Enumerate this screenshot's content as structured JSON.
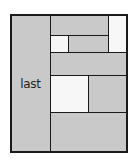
{
  "diagram": {
    "type": "rectangle-partition",
    "colors": {
      "filled": "#c9c9c9",
      "empty": "#f7f7f7",
      "stroke": "#1a1a1a"
    },
    "cells": [
      {
        "id": "last",
        "label": "last",
        "fill": "filled"
      },
      {
        "id": "r1-left",
        "label": "",
        "fill": "filled"
      },
      {
        "id": "r1-right",
        "label": "",
        "fill": "empty"
      },
      {
        "id": "r2-small",
        "label": "",
        "fill": "empty"
      },
      {
        "id": "r2-mid",
        "label": "",
        "fill": "filled"
      },
      {
        "id": "r3-wide",
        "label": "",
        "fill": "filled"
      },
      {
        "id": "r4-left",
        "label": "",
        "fill": "empty"
      },
      {
        "id": "r4-right",
        "label": "",
        "fill": "filled"
      },
      {
        "id": "r5-bottom",
        "label": "",
        "fill": "filled"
      }
    ]
  }
}
